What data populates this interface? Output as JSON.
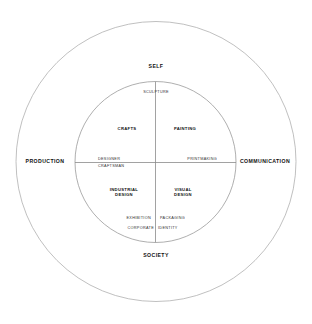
{
  "diagram": {
    "type": "concentric-circle-quadrant",
    "colors": {
      "background": "#ffffff",
      "stroke": "#b0b0b0",
      "text": "#111111"
    },
    "outer_circle": {
      "cx": 156,
      "cy": 161.5,
      "r": 140
    },
    "inner_circle": {
      "cx": 155.5,
      "cy": 162,
      "r": 80.5
    },
    "axes": {
      "top": "SELF",
      "bottom": "SOCIETY",
      "left": "PRODUCTION",
      "right": "COMMUNICATION"
    },
    "quadrants": {
      "top_left": "CRAFTS",
      "top_right": "PAINTING",
      "bottom_left_line1": "INDUSTRIAL",
      "bottom_left_line2": "DESIGN",
      "bottom_right_line1": "VISUAL",
      "bottom_right_line2": "DESIGN"
    },
    "boundary_labels": {
      "top": "SCULPTURE",
      "left_upper": "DESIGNER",
      "left_lower": "CRAFTSMAN",
      "right": "PRINTMAKING",
      "bottom_left_upper": "EXHIBITION",
      "bottom_right_upper": "PACKAGING",
      "bottom_left_lower": "CORPORATE",
      "bottom_right_lower": "IDENTITY"
    }
  }
}
